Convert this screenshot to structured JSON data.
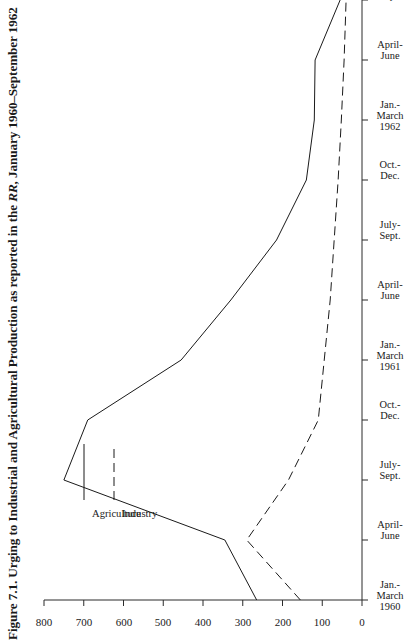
{
  "figure": {
    "number": "Figure 7.1.",
    "caption_before": "Figure 7.1. Urging to Industrial and Agricultural Production as reported in the ",
    "caption_italic": "RR",
    "caption_after": ", January 1960–September 1962",
    "full_caption": "Figure 7.1. Urging to Industrial and Agricultural Production as reported in the RR, January 1960–September 1962"
  },
  "legend": {
    "position": "top-left",
    "items": [
      {
        "label": "Agriculture",
        "style": "solid"
      },
      {
        "label": "Industry",
        "style": "dashed"
      }
    ]
  },
  "colors": {
    "ink": "#1a1a1a",
    "axis": "#2b2b2b",
    "background": "#ffffff"
  },
  "chart_data": {
    "type": "line",
    "orientation": "rotated-90",
    "xlabel": "",
    "ylabel": "",
    "grid": false,
    "ylim": [
      0,
      800
    ],
    "yticks": [
      0,
      100,
      200,
      300,
      400,
      500,
      600,
      700,
      800
    ],
    "ytick_labels": [
      "0",
      "100",
      "200",
      "300",
      "400",
      "500",
      "600",
      "700",
      "800"
    ],
    "categories": [
      "Jan.-\nMarch\n1960",
      "April-\nJune",
      "July-\nSept.",
      "Oct.-\nDec.",
      "Jan.-\nMarch\n1961",
      "April-\nJune",
      "July-\nSept.",
      "Oct.-\nDec.",
      "Jan.-\nMarch\n1962",
      "April-\nJune",
      "July-\nSept."
    ],
    "category_lines": [
      [
        "Jan.-",
        "March",
        "1960"
      ],
      [
        "April-",
        "June"
      ],
      [
        "July-",
        "Sept."
      ],
      [
        "Oct.-",
        "Dec."
      ],
      [
        "Jan.-",
        "March",
        "1961"
      ],
      [
        "April-",
        "June"
      ],
      [
        "July-",
        "Sept."
      ],
      [
        "Oct.-",
        "Dec."
      ],
      [
        "Jan.-",
        "March",
        "1962"
      ],
      [
        "April-",
        "June"
      ],
      [
        "July-",
        "Sept."
      ]
    ],
    "series": [
      {
        "name": "Agriculture",
        "style": "solid",
        "values": [
          265,
          345,
          750,
          690,
          455,
          330,
          215,
          140,
          120,
          118,
          55
        ]
      },
      {
        "name": "Industry",
        "style": "dashed",
        "values": [
          155,
          290,
          185,
          110,
          95,
          80,
          70,
          60,
          52,
          45,
          40
        ]
      }
    ]
  }
}
